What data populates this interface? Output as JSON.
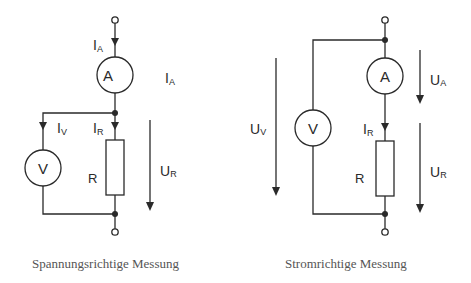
{
  "colors": {
    "line": "#2a2a2a",
    "caption": "#555555",
    "background": "#ffffff"
  },
  "left_circuit": {
    "caption": "Spannungsrichtige Messung",
    "ammeter_symbol": "A",
    "voltmeter_symbol": "V",
    "resistor_label": "R",
    "labels": {
      "ia_in": {
        "main": "I",
        "sub": "A"
      },
      "ia_right": {
        "main": "I",
        "sub": "A"
      },
      "iv": {
        "main": "I",
        "sub": "V"
      },
      "ir": {
        "main": "I",
        "sub": "R"
      },
      "ur": {
        "main": "U",
        "sub": "R"
      }
    }
  },
  "right_circuit": {
    "caption": "Stromrichtige Messung",
    "ammeter_symbol": "A",
    "voltmeter_symbol": "V",
    "resistor_label": "R",
    "labels": {
      "ua": {
        "main": "U",
        "sub": "A"
      },
      "uv": {
        "main": "U",
        "sub": "V"
      },
      "ir": {
        "main": "I",
        "sub": "R"
      },
      "ur": {
        "main": "U",
        "sub": "R"
      }
    }
  }
}
